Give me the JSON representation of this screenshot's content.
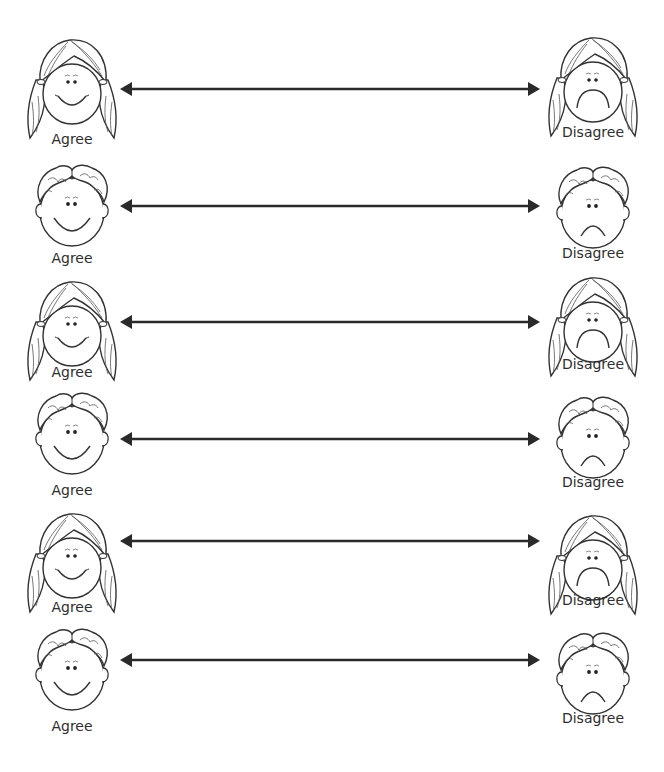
{
  "worksheet": {
    "rows": [
      {
        "left": {
          "type": "girl",
          "mood": "happy",
          "label": "Agree"
        },
        "right": {
          "type": "girl",
          "mood": "sad",
          "label": "Disagree"
        }
      },
      {
        "left": {
          "type": "boy",
          "mood": "happy",
          "label": "Agree"
        },
        "right": {
          "type": "boy",
          "mood": "sad",
          "label": "Disagree"
        }
      },
      {
        "left": {
          "type": "girl",
          "mood": "happy",
          "label": "Agree"
        },
        "right": {
          "type": "girl",
          "mood": "sad",
          "label": "Disagree"
        }
      },
      {
        "left": {
          "type": "boy",
          "mood": "happy",
          "label": "Agree"
        },
        "right": {
          "type": "boy",
          "mood": "sad",
          "label": "Disagree"
        }
      },
      {
        "left": {
          "type": "girl",
          "mood": "happy",
          "label": "Agree"
        },
        "right": {
          "type": "girl",
          "mood": "sad",
          "label": "Disagree"
        }
      },
      {
        "left": {
          "type": "boy",
          "mood": "happy",
          "label": "Agree"
        },
        "right": {
          "type": "boy",
          "mood": "sad",
          "label": "Disagree"
        }
      }
    ],
    "line_color": "#2a2a2a",
    "icons": {
      "girl": "girl-face-icon",
      "boy": "boy-face-icon",
      "arrow": "double-arrow-line"
    }
  }
}
